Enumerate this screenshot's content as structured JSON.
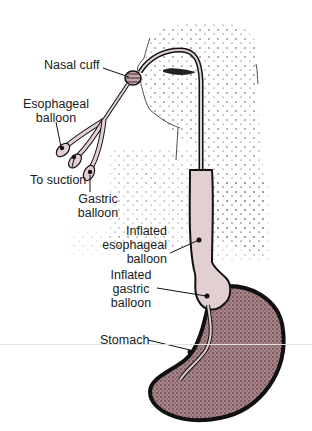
{
  "diagram": {
    "labels": {
      "nasal_cuff": "Nasal cuff",
      "esophageal_balloon_l1": "Esophageal",
      "esophageal_balloon_l2": "balloon",
      "to_suction": "To suction",
      "gastric_balloon_l1": "Gastric",
      "gastric_balloon_l2": "balloon",
      "inflated_esophageal_l1": "Inflated",
      "inflated_esophageal_l2": "esophageal",
      "inflated_esophageal_l3": "balloon",
      "inflated_gastric_l1": "Inflated",
      "inflated_gastric_l2": "gastric",
      "inflated_gastric_l3": "balloon",
      "stomach": "Stomach"
    },
    "colors": {
      "tube_fill": "#e2cfd1",
      "stomach_fill": "#a47d82",
      "outline": "#111111",
      "stipple": "#333333",
      "background": "#ffffff"
    }
  }
}
